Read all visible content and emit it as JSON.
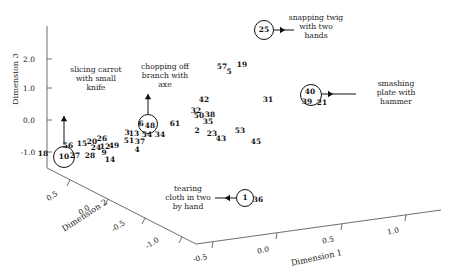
{
  "chart_data": {
    "type": "scatter",
    "title": "",
    "subtitle": "",
    "projection": "3d",
    "grid": false,
    "legend_position": "none",
    "axes": {
      "dim1": {
        "label": "Dimension 1",
        "ticks": [
          "-0.5",
          "0.0",
          "0.5",
          "1.0"
        ],
        "range": [
          -0.75,
          1.25
        ]
      },
      "dim2": {
        "label": "Dimension 2",
        "ticks": [
          "0.5",
          "0.0",
          "-0.5",
          "-1.0"
        ],
        "range": [
          -1.25,
          0.75
        ]
      },
      "dim3": {
        "label": "Dimension 3",
        "ticks": [
          "2.0",
          "1.0",
          "0.0",
          "-1.0"
        ],
        "range": [
          -1.6,
          2.6
        ]
      }
    },
    "points": [
      {
        "label": "18",
        "x": 43.0,
        "y": 154.0
      },
      {
        "label": "10",
        "x": 64.0,
        "y": 157.0,
        "circled": true,
        "r": 10.5
      },
      {
        "label": "27",
        "x": 75.0,
        "y": 156.0
      },
      {
        "label": "28",
        "x": 90.0,
        "y": 156.0
      },
      {
        "label": "56",
        "x": 68.0,
        "y": 146.0
      },
      {
        "label": "15",
        "x": 82.0,
        "y": 144.0
      },
      {
        "label": "20",
        "x": 92.0,
        "y": 142.0
      },
      {
        "label": "26",
        "x": 102.0,
        "y": 139.0
      },
      {
        "label": "24",
        "x": 96.0,
        "y": 148.0
      },
      {
        "label": "12",
        "x": 105.0,
        "y": 147.0
      },
      {
        "label": "49",
        "x": 114.0,
        "y": 146.0
      },
      {
        "label": "9",
        "x": 104.0,
        "y": 153.0
      },
      {
        "label": "14",
        "x": 110.0,
        "y": 160.0
      },
      {
        "label": "3",
        "x": 127.0,
        "y": 133.0
      },
      {
        "label": "13",
        "x": 134.0,
        "y": 134.0
      },
      {
        "label": "51",
        "x": 129.0,
        "y": 141.0
      },
      {
        "label": "37",
        "x": 140.0,
        "y": 142.0
      },
      {
        "label": "54",
        "x": 147.0,
        "y": 135.0
      },
      {
        "label": "4",
        "x": 137.0,
        "y": 150.0
      },
      {
        "label": "34",
        "x": 160.0,
        "y": 135.0
      },
      {
        "label": "6",
        "x": 141.0,
        "y": 124.0
      },
      {
        "label": "48",
        "x": 150.0,
        "y": 126.0,
        "circled": true,
        "r": 9.5,
        "circle_x": 148.0,
        "circle_y": 124.0
      },
      {
        "label": "61",
        "x": 175.0,
        "y": 124.0
      },
      {
        "label": "42",
        "x": 204.0,
        "y": 100.0
      },
      {
        "label": "32",
        "x": 196.0,
        "y": 111.0
      },
      {
        "label": "50",
        "x": 199.0,
        "y": 116.0
      },
      {
        "label": "38",
        "x": 210.0,
        "y": 115.0
      },
      {
        "label": "35",
        "x": 208.0,
        "y": 122.0
      },
      {
        "label": "2",
        "x": 197.0,
        "y": 131.0
      },
      {
        "label": "23",
        "x": 212.0,
        "y": 134.0
      },
      {
        "label": "43",
        "x": 221.0,
        "y": 139.0
      },
      {
        "label": "53",
        "x": 240.0,
        "y": 131.0
      },
      {
        "label": "45",
        "x": 256.0,
        "y": 142.0
      },
      {
        "label": "57",
        "x": 222.0,
        "y": 67.0
      },
      {
        "label": "5",
        "x": 229.0,
        "y": 72.0
      },
      {
        "label": "19",
        "x": 242.0,
        "y": 65.0
      },
      {
        "label": "31",
        "x": 268.0,
        "y": 100.0
      },
      {
        "label": "25",
        "x": 264.0,
        "y": 30.0,
        "circled": true,
        "r": 9.5
      },
      {
        "label": "40",
        "x": 310.0,
        "y": 92.0,
        "circled": true,
        "r": 10.5,
        "circle_x": 311.0,
        "circle_y": 95.0
      },
      {
        "label": "39",
        "x": 307.0,
        "y": 102.0
      },
      {
        "label": "21",
        "x": 322.0,
        "y": 103.0
      },
      {
        "label": "1",
        "x": 245.0,
        "y": 198.0,
        "circled": true,
        "r": 8.5
      },
      {
        "label": "36",
        "x": 258.0,
        "y": 200.0
      }
    ],
    "annotations": [
      {
        "id": "slicing-carrot",
        "text": "slicing carrot\nwith small\nknife",
        "x": 96.0,
        "y": 79.0,
        "arrow": {
          "x1": 64.0,
          "y1": 116.0,
          "x2": 64.0,
          "y2": 144.0,
          "head": "up"
        }
      },
      {
        "id": "chopping-branch",
        "text": "chopping off\nbranch with\naxe",
        "x": 165.0,
        "y": 76.0,
        "arrow": {
          "x1": 148.0,
          "y1": 94.0,
          "x2": 148.0,
          "y2": 114.0,
          "head": "up"
        }
      },
      {
        "id": "snapping-twig",
        "text": "snapping twig\nwith two\nhands",
        "x": 316.0,
        "y": 27.0,
        "arrow": {
          "x1": 274.0,
          "y1": 30.0,
          "x2": 294.0,
          "y2": 30.0,
          "head": "right"
        }
      },
      {
        "id": "smashing-plate",
        "text": "smashing\nplate with\nhammer",
        "x": 396.0,
        "y": 93.0,
        "arrow": {
          "x1": 322.0,
          "y1": 94.0,
          "x2": 356.0,
          "y2": 94.0,
          "head": "right"
        }
      },
      {
        "id": "tearing-cloth",
        "text": "tearing\ncloth in two\nby hand",
        "x": 188.0,
        "y": 198.0,
        "arrow": {
          "x1": 236.0,
          "y1": 198.0,
          "x2": 215.0,
          "y2": 198.0,
          "head": "left"
        }
      }
    ]
  },
  "axis_titles": {
    "dim1": "Dimension 1",
    "dim2": "Dimension 2",
    "dim3": "Dimension 3"
  },
  "axis_ticks": {
    "dim3": [
      {
        "label": "2.0",
        "x": 29,
        "y": 59
      },
      {
        "label": "1.0",
        "x": 29,
        "y": 88
      },
      {
        "label": "0.0",
        "x": 29,
        "y": 120
      },
      {
        "label": "-1.0",
        "x": 28,
        "y": 152
      }
    ],
    "dim2": [
      {
        "label": "0.5",
        "x": 52,
        "y": 196,
        "rot": -33
      },
      {
        "label": "0.0",
        "x": 84,
        "y": 210,
        "rot": -33
      },
      {
        "label": "-0.5",
        "x": 118,
        "y": 226,
        "rot": -33
      },
      {
        "label": "-1.0",
        "x": 152,
        "y": 243,
        "rot": -33
      }
    ],
    "dim1": [
      {
        "label": "-0.5",
        "x": 200,
        "y": 258,
        "rot": -12
      },
      {
        "label": "0.0",
        "x": 263,
        "y": 250,
        "rot": -12
      },
      {
        "label": "0.5",
        "x": 328,
        "y": 240,
        "rot": -12
      },
      {
        "label": "1.0",
        "x": 393,
        "y": 231,
        "rot": -12
      }
    ]
  },
  "axis_title_pos": {
    "dim3": {
      "x": 10,
      "y": 105,
      "rot": -90
    },
    "dim2": {
      "x": 60,
      "y": 225,
      "rot": -33
    },
    "dim1": {
      "x": 290,
      "y": 258,
      "rot": -12
    }
  },
  "colors": {
    "axis": "#4a4a4a",
    "text": "#1a1a1a",
    "point": "#111111",
    "background": "#ffffff"
  }
}
